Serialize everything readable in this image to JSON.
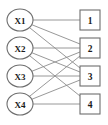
{
  "diagram": {
    "type": "bipartite-graph",
    "title": "",
    "left_nodes": [
      {
        "id": "X1",
        "label": "X1",
        "shape": "circle",
        "cx": 20,
        "cy": 20,
        "rx": 13,
        "ry": 11
      },
      {
        "id": "X2",
        "label": "X2",
        "shape": "circle",
        "cx": 20,
        "cy": 48,
        "rx": 13,
        "ry": 11
      },
      {
        "id": "X3",
        "label": "X3",
        "shape": "circle",
        "cx": 20,
        "cy": 76,
        "rx": 13,
        "ry": 11
      },
      {
        "id": "X4",
        "label": "X4",
        "shape": "circle",
        "cx": 20,
        "cy": 104,
        "rx": 13,
        "ry": 11
      }
    ],
    "right_nodes": [
      {
        "id": "1",
        "label": "1",
        "shape": "square",
        "cx": 90,
        "cy": 20,
        "size": 20
      },
      {
        "id": "2",
        "label": "2",
        "shape": "square",
        "cx": 90,
        "cy": 48,
        "size": 20
      },
      {
        "id": "3",
        "label": "3",
        "shape": "square",
        "cx": 90,
        "cy": 76,
        "size": 20
      },
      {
        "id": "4",
        "label": "4",
        "shape": "square",
        "cx": 90,
        "cy": 104,
        "size": 20
      }
    ],
    "edges": [
      {
        "from": "X1",
        "to": "1"
      },
      {
        "from": "X1",
        "to": "2"
      },
      {
        "from": "X1",
        "to": "3"
      },
      {
        "from": "X2",
        "to": "2"
      },
      {
        "from": "X2",
        "to": "3"
      },
      {
        "from": "X2",
        "to": "4"
      },
      {
        "from": "X3",
        "to": "2"
      },
      {
        "from": "X3",
        "to": "3"
      },
      {
        "from": "X4",
        "to": "2"
      },
      {
        "from": "X4",
        "to": "3"
      },
      {
        "from": "X4",
        "to": "4"
      }
    ],
    "colors": {
      "edge": "#8c8c8c",
      "node_stroke": "#6e6e6e",
      "node_fill": "#ffffff",
      "label_text": "#1a1a1a",
      "background": "#ffffff"
    }
  }
}
